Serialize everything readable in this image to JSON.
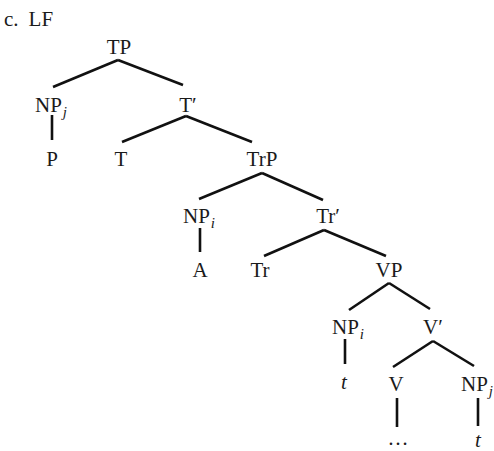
{
  "caption": {
    "label": "c.",
    "title": "LF"
  },
  "nodes": {
    "tp": {
      "label": "TP"
    },
    "npj_top": {
      "label": "NP",
      "sub": "j"
    },
    "tbar": {
      "label": "T′"
    },
    "p": {
      "label": "P"
    },
    "t_head": {
      "label": "T"
    },
    "trp": {
      "label": "TrP"
    },
    "npi_mid": {
      "label": "NP",
      "sub": "i"
    },
    "trbar": {
      "label": "Tr′"
    },
    "a": {
      "label": "A"
    },
    "tr_head": {
      "label": "Tr"
    },
    "vp": {
      "label": "VP"
    },
    "npi_low": {
      "label": "NP",
      "sub": "i"
    },
    "vbar": {
      "label": "V′"
    },
    "trace_i": {
      "label": "t"
    },
    "v_head": {
      "label": "V"
    },
    "npj_low": {
      "label": "NP",
      "sub": "j"
    },
    "ellipsis": {
      "label": "…"
    },
    "trace_j": {
      "label": "t"
    }
  },
  "colors": {
    "ink": "#111111",
    "background": "#ffffff"
  }
}
